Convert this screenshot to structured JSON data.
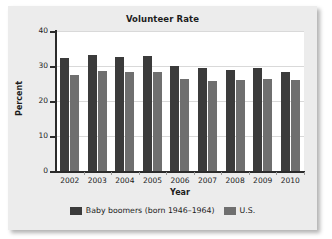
{
  "chart_data": {
    "type": "bar",
    "title": "Volunteer Rate",
    "xlabel": "Year",
    "ylabel": "Percent",
    "categories": [
      "2002",
      "2003",
      "2004",
      "2005",
      "2006",
      "2007",
      "2008",
      "2009",
      "2010"
    ],
    "series": [
      {
        "name": "Baby boomers (born 1946–1964)",
        "color": "#3b3b3b",
        "values": [
          32.2,
          33.2,
          32.7,
          32.8,
          30.1,
          29.5,
          29.0,
          29.3,
          28.2
        ]
      },
      {
        "name": "U.S.",
        "color": "#6f6f6f",
        "values": [
          27.3,
          28.5,
          28.4,
          28.4,
          26.3,
          25.8,
          25.9,
          26.3,
          25.9
        ]
      }
    ],
    "ylim": [
      0,
      40
    ],
    "yticks": [
      "0",
      "10",
      "20",
      "30",
      "40"
    ],
    "ytick_values": [
      0,
      10,
      20,
      30,
      40
    ],
    "grid": true,
    "legend_position": "bottom"
  },
  "legend": {
    "entries": [
      {
        "label": "Baby boomers (born 1946–1964)"
      },
      {
        "label": "U.S."
      }
    ]
  }
}
